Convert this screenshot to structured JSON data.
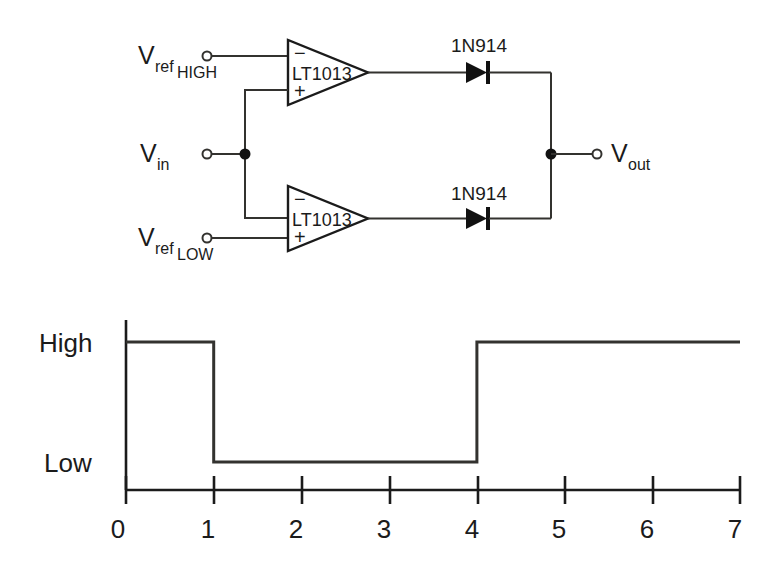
{
  "figure": {
    "kind": "window-comparator-schematic-with-output-waveform"
  },
  "circuit": {
    "labels": {
      "vref_high_main": "V",
      "vref_high_sub": "ref",
      "vref_high_sub2": "HIGH",
      "vref_low_main": "V",
      "vref_low_sub": "ref",
      "vref_low_sub2": "LOW",
      "vin_main": "V",
      "vin_sub": "in",
      "vout_main": "V",
      "vout_sub": "out"
    },
    "opamps": [
      {
        "id": "upper",
        "part": "LT1013",
        "minus": "−",
        "plus": "+",
        "minus_input": "Vref_HIGH",
        "plus_input": "Vin"
      },
      {
        "id": "lower",
        "part": "LT1013",
        "minus": "−",
        "plus": "+",
        "minus_input": "Vin",
        "plus_input": "Vref_LOW"
      }
    ],
    "diodes": [
      {
        "id": "upper-diode",
        "part": "1N914"
      },
      {
        "id": "lower-diode",
        "part": "1N914"
      }
    ]
  },
  "chart_data": {
    "type": "line",
    "title": "",
    "xlabel": "",
    "ylabel": "",
    "xlim": [
      0,
      7
    ],
    "ylim": [
      0,
      1
    ],
    "grid": false,
    "legend": false,
    "x_ticks": [
      "0",
      "1",
      "2",
      "3",
      "4",
      "5",
      "6",
      "7"
    ],
    "x_tick_values": [
      0,
      1,
      2,
      3,
      4,
      5,
      6,
      7
    ],
    "y_ticks": [
      "Low",
      "High"
    ],
    "y_tick_values": [
      0,
      1
    ],
    "series": [
      {
        "name": "Vout",
        "step": "post",
        "x": [
          0,
          1,
          1,
          4,
          4,
          7
        ],
        "y": [
          1,
          1,
          0,
          0,
          1,
          1
        ],
        "states": [
          "High",
          "High",
          "Low",
          "Low",
          "High",
          "High"
        ]
      }
    ],
    "transitions": [
      {
        "x": 1,
        "from": "High",
        "to": "Low"
      },
      {
        "x": 4,
        "from": "Low",
        "to": "High"
      }
    ]
  },
  "plot": {
    "level_high_label": "High",
    "level_low_label": "Low"
  },
  "colors": {
    "ink": "#1b1b1b",
    "wire": "#33322f",
    "paper": "#ffffff"
  }
}
